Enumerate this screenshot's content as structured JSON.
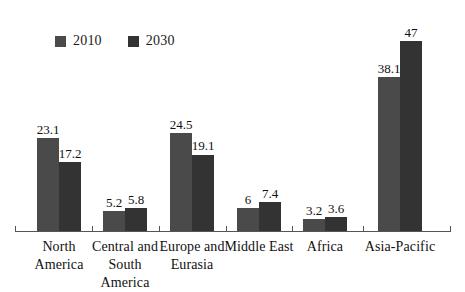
{
  "chart_data": {
    "type": "bar",
    "title": "",
    "subtitle": "",
    "xlabel": "",
    "ylabel": "",
    "ylim": [
      0,
      52
    ],
    "grid": false,
    "legend_position": "top-left",
    "categories": [
      "North America",
      "Central and South America",
      "Europe and Eurasia",
      "Middle East",
      "Africa",
      "Asia-Pacific"
    ],
    "series": [
      {
        "name": "2010",
        "color": "#4a4a4a",
        "values": [
          23.1,
          5.2,
          24.5,
          6,
          3.2,
          38.1
        ],
        "labels": [
          "23.1",
          "5.2",
          "24.5",
          "6",
          "3.2",
          "38.1"
        ]
      },
      {
        "name": "2030",
        "color": "#333333",
        "values": [
          17.2,
          5.8,
          19.1,
          7.4,
          3.6,
          47
        ],
        "labels": [
          "17.2",
          "5.8",
          "19.1",
          "7.4",
          "3.6",
          "47"
        ]
      }
    ]
  },
  "legend": {
    "items": [
      {
        "label": "2010",
        "swatch_color": "#4a4a4a"
      },
      {
        "label": "2030",
        "swatch_color": "#333333"
      }
    ]
  },
  "axis": {
    "line_color": "#555555"
  },
  "category_labels": [
    {
      "lines": [
        "North",
        "America"
      ]
    },
    {
      "lines": [
        "Central and",
        "South",
        "America"
      ]
    },
    {
      "lines": [
        "Europe and",
        "Eurasia"
      ]
    },
    {
      "lines": [
        "Middle East"
      ]
    },
    {
      "lines": [
        "Africa"
      ]
    },
    {
      "lines": [
        "Asia-Pacific"
      ]
    }
  ]
}
